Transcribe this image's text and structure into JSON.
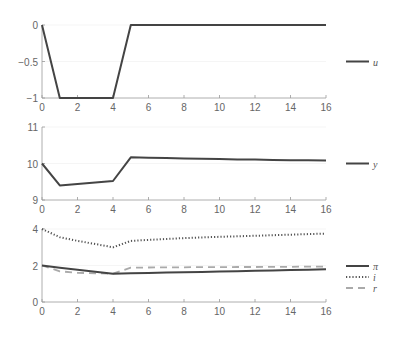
{
  "chart_data": [
    {
      "type": "line",
      "panel": "top",
      "title": "",
      "xlabel": "",
      "ylabel": "",
      "xlim": [
        0,
        16
      ],
      "ylim": [
        -1,
        0
      ],
      "xticks": [
        0,
        2,
        4,
        6,
        8,
        10,
        12,
        14,
        16
      ],
      "yticks": [
        -1,
        -0.5,
        0
      ],
      "ytick_labels": [
        "−1",
        "−0.5",
        "0"
      ],
      "grid": false,
      "legend_position": "right",
      "series": [
        {
          "name": "u",
          "style": "solid",
          "color": "#444444",
          "x": [
            0,
            1,
            2,
            3,
            4,
            5,
            6,
            7,
            8,
            9,
            10,
            11,
            12,
            13,
            14,
            15,
            16
          ],
          "values": [
            0,
            -1,
            -1,
            -1,
            -1,
            0,
            0,
            0,
            0,
            0,
            0,
            0,
            0,
            0,
            0,
            0,
            0
          ]
        }
      ]
    },
    {
      "type": "line",
      "panel": "middle",
      "title": "",
      "xlabel": "",
      "ylabel": "",
      "xlim": [
        0,
        16
      ],
      "ylim": [
        9,
        11
      ],
      "xticks": [
        0,
        2,
        4,
        6,
        8,
        10,
        12,
        14,
        16
      ],
      "yticks": [
        9,
        10,
        11
      ],
      "ytick_labels": [
        "9",
        "10",
        "11"
      ],
      "grid": false,
      "legend_position": "right",
      "series": [
        {
          "name": "y",
          "style": "solid",
          "color": "#444444",
          "x": [
            0,
            1,
            2,
            3,
            4,
            5,
            6,
            7,
            8,
            9,
            10,
            11,
            12,
            13,
            14,
            15,
            16
          ],
          "values": [
            10.0,
            9.4,
            9.44,
            9.48,
            9.52,
            10.17,
            10.16,
            10.15,
            10.14,
            10.13,
            10.12,
            10.11,
            10.11,
            10.1,
            10.09,
            10.09,
            10.08
          ]
        }
      ]
    },
    {
      "type": "line",
      "panel": "bottom",
      "title": "",
      "xlabel": "",
      "ylabel": "",
      "xlim": [
        0,
        16
      ],
      "ylim": [
        0,
        4
      ],
      "xticks": [
        0,
        2,
        4,
        6,
        8,
        10,
        12,
        14,
        16
      ],
      "yticks": [
        0,
        2,
        4
      ],
      "ytick_labels": [
        "0",
        "2",
        "4"
      ],
      "grid": false,
      "legend_position": "right",
      "series": [
        {
          "name": "π",
          "style": "solid",
          "color": "#444444",
          "x": [
            0,
            1,
            2,
            3,
            4,
            5,
            6,
            7,
            8,
            9,
            10,
            11,
            12,
            13,
            14,
            15,
            16
          ],
          "values": [
            2.0,
            1.88,
            1.77,
            1.66,
            1.55,
            1.57,
            1.59,
            1.61,
            1.63,
            1.65,
            1.67,
            1.69,
            1.71,
            1.73,
            1.75,
            1.77,
            1.79
          ]
        },
        {
          "name": "i",
          "style": "dotted",
          "color": "#555555",
          "x": [
            0,
            1,
            2,
            3,
            4,
            5,
            6,
            7,
            8,
            9,
            10,
            11,
            12,
            13,
            14,
            15,
            16
          ],
          "values": [
            4.0,
            3.55,
            3.35,
            3.18,
            3.0,
            3.35,
            3.4,
            3.45,
            3.5,
            3.54,
            3.57,
            3.6,
            3.63,
            3.66,
            3.69,
            3.72,
            3.75
          ]
        },
        {
          "name": "r",
          "style": "dashed",
          "color": "#aaaaaa",
          "x": [
            0,
            1,
            2,
            3,
            4,
            5,
            6,
            7,
            8,
            9,
            10,
            11,
            12,
            13,
            14,
            15,
            16
          ],
          "values": [
            2.0,
            1.68,
            1.6,
            1.57,
            1.55,
            1.88,
            1.89,
            1.9,
            1.9,
            1.91,
            1.91,
            1.92,
            1.92,
            1.93,
            1.93,
            1.94,
            1.94
          ]
        }
      ]
    }
  ],
  "legends": {
    "top": [
      {
        "label": "u",
        "style": "solid"
      }
    ],
    "middle": [
      {
        "label": "y",
        "style": "solid"
      }
    ],
    "bottom": [
      {
        "label": "π",
        "style": "solid"
      },
      {
        "label": "i",
        "style": "dotted"
      },
      {
        "label": "r",
        "style": "dashed"
      }
    ]
  }
}
